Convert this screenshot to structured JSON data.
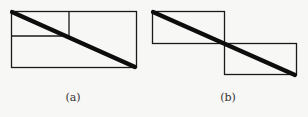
{
  "figures": [
    {
      "id": "a",
      "label": "(a)",
      "description": "Rectangle subdivided with a small upper-left sub-rectangle, crossed by a thick diagonal"
    },
    {
      "id": "b",
      "label": "(b)",
      "description": "Two offset rectangles joined at a corner, crossed by a thick diagonal"
    }
  ],
  "colors": {
    "line": "#1a1a1a",
    "background": "#f7f7f5"
  }
}
